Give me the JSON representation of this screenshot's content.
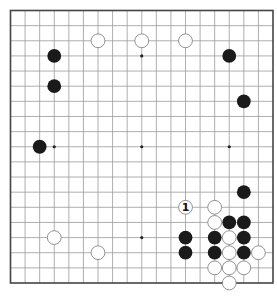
{
  "diagram": {
    "type": "go-board",
    "size": 19,
    "colors": {
      "background": "#ffffff",
      "grid_line": "#9a9a9a",
      "border": "#444444",
      "black_stone": "#1a1a1a",
      "white_stone_fill": "#ffffff",
      "white_stone_stroke": "#777777",
      "star_point": "#222222"
    },
    "star_points": [
      [
        3,
        3
      ],
      [
        9,
        3
      ],
      [
        15,
        3
      ],
      [
        3,
        9
      ],
      [
        9,
        9
      ],
      [
        15,
        9
      ],
      [
        3,
        15
      ],
      [
        9,
        15
      ],
      [
        15,
        15
      ]
    ],
    "black_stones": [
      [
        3,
        3
      ],
      [
        3,
        5
      ],
      [
        2,
        9
      ],
      [
        15,
        3
      ],
      [
        16,
        6
      ],
      [
        16,
        12
      ],
      [
        15,
        14
      ],
      [
        16,
        14
      ],
      [
        12,
        15
      ],
      [
        14,
        15
      ],
      [
        16,
        15
      ],
      [
        12,
        16
      ],
      [
        14,
        16
      ],
      [
        16,
        16
      ]
    ],
    "white_stones": [
      [
        6,
        2
      ],
      [
        9,
        2
      ],
      [
        12,
        2
      ],
      [
        3,
        15
      ],
      [
        6,
        16
      ],
      [
        14,
        13
      ],
      [
        14,
        14
      ],
      [
        15,
        15
      ],
      [
        15,
        16
      ],
      [
        17,
        16
      ],
      [
        14,
        17
      ],
      [
        15,
        17
      ],
      [
        16,
        17
      ],
      [
        15,
        18
      ]
    ],
    "labeled_stones": [
      {
        "col": 12,
        "row": 13,
        "color": "white",
        "label": "1"
      }
    ]
  }
}
